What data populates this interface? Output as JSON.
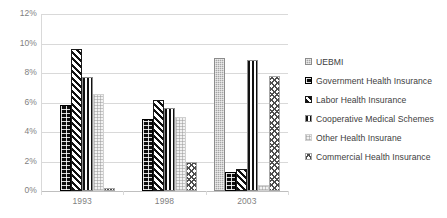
{
  "chart_data": {
    "type": "bar",
    "title": "",
    "subtitle": "",
    "xlabel": "",
    "ylabel": "",
    "categories": [
      "1993",
      "1998",
      "2003"
    ],
    "ylim": [
      0,
      12
    ],
    "y_ticks": [
      "0%",
      "2%",
      "4%",
      "6%",
      "8%",
      "10%",
      "12%"
    ],
    "y_tick_values": [
      0,
      2,
      4,
      6,
      8,
      10,
      12
    ],
    "grid": true,
    "legend_position": "right",
    "value_suffix": "%",
    "series": [
      {
        "name": "UEBMI",
        "pattern": "uebmi",
        "color": "#a6a6a6",
        "values": [
          0,
          0,
          9.0
        ]
      },
      {
        "name": "Government Health Insurance",
        "pattern": "gov",
        "color": "#0d0d0d",
        "values": [
          5.8,
          4.9,
          1.3
        ]
      },
      {
        "name": "Labor Health Insurance",
        "pattern": "labor",
        "color": "#111111",
        "values": [
          9.6,
          6.2,
          1.5
        ]
      },
      {
        "name": "Cooperative Medical Schemes",
        "pattern": "coop",
        "color": "#111111",
        "values": [
          7.7,
          5.6,
          8.9
        ]
      },
      {
        "name": "Other Health Insurane",
        "pattern": "other",
        "color": "#f2f2f2",
        "values": [
          6.6,
          5.0,
          0.4
        ]
      },
      {
        "name": "Commercial Health Insurance",
        "pattern": "comm",
        "color": "#4d4d4d",
        "values": [
          0.2,
          2.0,
          7.8
        ]
      }
    ]
  }
}
